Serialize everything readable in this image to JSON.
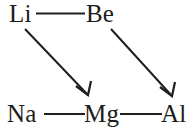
{
  "figure": {
    "kind": "diagonal-relationship-diagram",
    "background_color": "#ffffff",
    "ink_color": "#1f1f1f"
  },
  "nodes": {
    "li": {
      "label": "Li",
      "x": 9,
      "y": 1
    },
    "be": {
      "label": "Be",
      "x": 86,
      "y": 1
    },
    "na": {
      "label": "Na",
      "x": 7,
      "y": 101
    },
    "mg": {
      "label": "Mg",
      "x": 84,
      "y": 101
    },
    "al": {
      "label": "Al",
      "x": 161,
      "y": 101
    }
  },
  "bonds": [
    {
      "name": "li-be-bond",
      "from": "Li",
      "to": "Be",
      "x1": 36,
      "y1": 13.5,
      "x2": 85,
      "y2": 13.5
    },
    {
      "name": "na-mg-bond",
      "from": "Na",
      "to": "Mg",
      "x1": 44,
      "y1": 114.0,
      "x2": 85,
      "y2": 114.0
    },
    {
      "name": "mg-al-bond",
      "from": "Mg",
      "to": "Al",
      "x1": 120,
      "y1": 114.0,
      "x2": 162,
      "y2": 114.0
    }
  ],
  "arrows": [
    {
      "name": "li-to-mg-arrow",
      "from": "Li",
      "to": "Mg",
      "x1": 25,
      "y1": 29,
      "x2": 88,
      "y2": 95,
      "barb_left": {
        "x": 76,
        "y": 86
      },
      "barb_right": {
        "x": 91,
        "y": 81
      }
    },
    {
      "name": "be-to-al-arrow",
      "from": "Be",
      "to": "Al",
      "x1": 111,
      "y1": 29,
      "x2": 172,
      "y2": 96,
      "barb_left": {
        "x": 160,
        "y": 87
      },
      "barb_right": {
        "x": 175,
        "y": 82
      }
    }
  ]
}
